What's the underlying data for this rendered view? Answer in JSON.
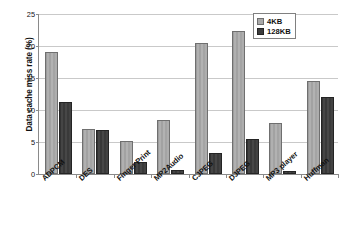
{
  "chart_data": {
    "type": "bar",
    "title": "",
    "xlabel": "",
    "ylabel": "Data cache miss rate (%)",
    "categories": [
      "ADPCM",
      "DES",
      "Finger Print",
      "MP2Audio",
      "CJPEG",
      "DJPEG",
      "MP3 player",
      "Huffman"
    ],
    "series": [
      {
        "name": "4KB",
        "color": "#a9a9a9",
        "values": [
          19.0,
          7.1,
          5.1,
          8.4,
          20.4,
          22.3,
          7.9,
          14.5
        ]
      },
      {
        "name": "128KB",
        "color": "#3d3d3d",
        "values": [
          11.3,
          6.9,
          1.8,
          0.6,
          3.3,
          5.4,
          0.5,
          12.0
        ]
      }
    ],
    "ylim": [
      0,
      25
    ],
    "yticks": [
      0,
      5,
      10,
      15,
      20,
      25
    ],
    "ytick_labels": [
      "0",
      "5",
      "10",
      "15",
      "20",
      "25"
    ],
    "grid": "horizontal",
    "legend_position": "top-right"
  }
}
